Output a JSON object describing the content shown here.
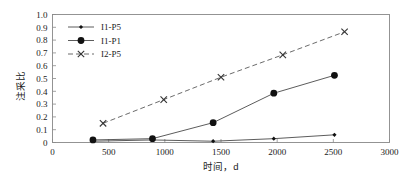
{
  "chart_data": {
    "type": "line",
    "title": "",
    "subtitle": "",
    "xlabel": "时间，d",
    "ylabel": "注采比",
    "xlim": [
      0,
      3000
    ],
    "ylim": [
      0,
      1.0
    ],
    "xticks": [
      0,
      500,
      1000,
      1500,
      2000,
      2500,
      3000
    ],
    "xtick_labels": [
      "0",
      "500",
      "1000",
      "1500",
      "2000",
      "2500",
      "3000"
    ],
    "yticks": [
      0,
      0.1,
      0.2,
      0.3,
      0.4,
      0.5,
      0.6,
      0.7,
      0.8,
      0.9,
      1.0
    ],
    "ytick_labels": [
      "0",
      "0.1",
      "0.2",
      "0.3",
      "0.4",
      "0.5",
      "0.6",
      "0.7",
      "0.8",
      "0.9",
      "1.0"
    ],
    "grid": false,
    "legend_position": "upper-left-inside",
    "frame": true,
    "series": [
      {
        "name": "I1-P5",
        "marker": "diamond-small",
        "linestyle": "solid",
        "color": "#111111",
        "x": [
          360,
          890,
          1430,
          1970,
          2510
        ],
        "values": [
          0.01,
          0.02,
          0.01,
          0.03,
          0.06
        ]
      },
      {
        "name": "I1-P1",
        "marker": "circle-filled",
        "linestyle": "solid",
        "color": "#111111",
        "x": [
          360,
          890,
          1430,
          1970,
          2510
        ],
        "values": [
          0.02,
          0.03,
          0.155,
          0.385,
          0.525
        ]
      },
      {
        "name": "I2-P5",
        "marker": "cross",
        "linestyle": "dashed",
        "color": "#333333",
        "x": [
          450,
          990,
          1500,
          2050,
          2600
        ],
        "values": [
          0.15,
          0.335,
          0.51,
          0.685,
          0.865
        ]
      }
    ]
  },
  "legend": {
    "entries": [
      {
        "label": "I1-P5"
      },
      {
        "label": "I1-P1"
      },
      {
        "label": "I2-P5"
      }
    ]
  },
  "axes": {
    "x_title": "时间，d",
    "y_title": "注采比"
  }
}
